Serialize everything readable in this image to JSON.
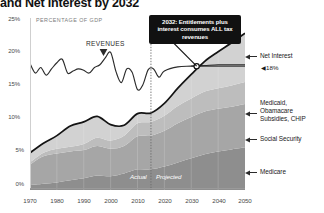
{
  "chart_data": {
    "type": "area",
    "title": "and Net Interest by 2032",
    "subtitle": "PERCENTAGE OF GDP",
    "xlabel": "",
    "ylabel": "PERCENTAGE OF GDP",
    "xlim": [
      1970,
      2050
    ],
    "ylim": [
      0,
      25
    ],
    "grid": false,
    "legend_position": "right-inline-labels",
    "x_ticks": [
      "1970",
      "1980",
      "1990",
      "2000",
      "2010",
      "2020",
      "2030",
      "2040",
      "2050"
    ],
    "y_ticks": [
      "0%",
      "5%",
      "10%",
      "15%",
      "20%",
      "25%"
    ],
    "x": [
      1970,
      1975,
      1980,
      1985,
      1990,
      1995,
      2000,
      2005,
      2010,
      2015,
      2020,
      2025,
      2030,
      2035,
      2040,
      2045,
      2050
    ],
    "series": [
      {
        "name": "Medicare",
        "color": "#8e8e8e",
        "values": [
          0.7,
          0.9,
          1.1,
          1.4,
          1.7,
          2.1,
          2.0,
          2.4,
          3.0,
          3.0,
          3.4,
          4.0,
          4.6,
          5.2,
          5.6,
          5.9,
          6.2
        ]
      },
      {
        "name": "Social Security",
        "color": "#a6a6a6",
        "values": [
          3.0,
          4.0,
          4.2,
          4.2,
          4.1,
          4.3,
          4.0,
          4.0,
          4.8,
          4.9,
          5.2,
          5.7,
          6.0,
          6.2,
          6.2,
          6.2,
          6.3
        ]
      },
      {
        "name": "Medicaid, Obamacare Subsidies, CHIP",
        "color": "#bdbdbd",
        "values": [
          0.3,
          0.5,
          0.7,
          0.7,
          0.9,
          1.2,
          1.2,
          1.5,
          1.9,
          2.0,
          2.2,
          2.5,
          2.7,
          2.9,
          3.0,
          3.1,
          3.2
        ]
      },
      {
        "name": "Net Interest",
        "color": "#d2d2d2",
        "values": [
          1.4,
          1.4,
          1.9,
          3.0,
          3.2,
          3.1,
          2.3,
          1.5,
          1.4,
          1.3,
          1.8,
          2.6,
          3.5,
          4.4,
          5.3,
          6.2,
          7.1
        ]
      }
    ],
    "revenue_line": {
      "name": "REVENUES",
      "color": "#2b2b2b",
      "x": [
        1970,
        1972,
        1974,
        1976,
        1978,
        1980,
        1982,
        1984,
        1986,
        1988,
        1990,
        1992,
        1994,
        1996,
        1998,
        2000,
        2002,
        2004,
        2006,
        2008,
        2010,
        2012,
        2014,
        2016,
        2018,
        2020,
        2025,
        2030,
        2035,
        2040,
        2045,
        2050
      ],
      "values": [
        18.4,
        17.0,
        17.8,
        16.7,
        17.6,
        18.5,
        19.0,
        17.0,
        17.3,
        17.6,
        17.4,
        17.0,
        17.8,
        18.2,
        19.2,
        20.0,
        17.2,
        15.6,
        17.6,
        17.1,
        14.6,
        15.3,
        17.5,
        17.6,
        16.4,
        17.3,
        17.9,
        18.0,
        18.1,
        18.2,
        18.2,
        18.2
      ]
    },
    "total_spending_line": {
      "name": "Total Spending",
      "color": "#1a1a1a"
    },
    "annotations": {
      "callout": "2032: Entitlements plus interest consumes ALL tax revenues",
      "callout_year": "2032",
      "revenue_marker": "◀18%",
      "revenue_marker_value": "18%",
      "actual_label": "Actual",
      "projected_label": "Projected",
      "divider_year": "2015",
      "crossover_year": "2032",
      "crossover_value": "18%"
    },
    "side_labels": [
      {
        "label": "Net Interest"
      },
      {
        "label": "Medicaid,\nObamacare\nSubsidies, CHIP"
      },
      {
        "label": "Social Security"
      },
      {
        "label": "Medicare"
      }
    ]
  },
  "labels": {
    "title": "and Net Interest by 2032",
    "subtitle": "PERCENTAGE OF GDP",
    "revenues": "REVENUES",
    "callout": "2032: Entitlements plus interest consumes ALL tax revenues",
    "pct18": "◀18%",
    "actual": "Actual",
    "projected": "Projected",
    "net_interest": "Net Interest",
    "medicaid_l1": "Medicaid,",
    "medicaid_l2": "Obamacare",
    "medicaid_l3": "Subsidies, CHIP",
    "social_security": "Social Security",
    "medicare": "Medicare",
    "y0": "0%",
    "y5": "5%",
    "y10": "10%",
    "y15": "15%",
    "y20": "20%",
    "y25": "25%",
    "x1970": "1970",
    "x1980": "1980",
    "x1990": "1990",
    "x2000": "2000",
    "x2010": "2010",
    "x2020": "2020",
    "x2030": "2030",
    "x2040": "2040",
    "x2050": "2050"
  }
}
